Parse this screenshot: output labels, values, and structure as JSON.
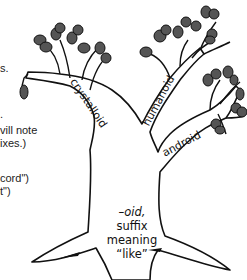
{
  "left_text_fragments": [
    {
      "text": "s.",
      "top": 62
    },
    {
      "text": ".",
      "top": 108
    },
    {
      "text": "vill note",
      "top": 124
    },
    {
      "text": "ixes.)",
      "top": 137
    },
    {
      "text": "cord\")",
      "top": 172
    },
    {
      "text": "t\")",
      "top": 185
    }
  ],
  "tree": {
    "branches": {
      "left": "crystalloid",
      "middle": "humanoid",
      "right": "android"
    },
    "trunk": {
      "line1": "–oid,",
      "line2": "suffix",
      "line3": "meaning",
      "line4": "“like”"
    }
  }
}
